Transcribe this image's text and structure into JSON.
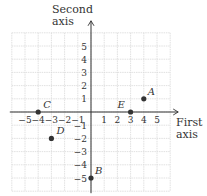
{
  "diagram": {
    "type": "coordinate-plane",
    "y_axis_title": [
      "Second",
      "axis"
    ],
    "x_axis_title": [
      "First",
      "axis"
    ],
    "x_ticks": [
      "-5",
      "-4",
      "-3",
      "-2",
      "-1",
      "1",
      "2",
      "3",
      "4",
      "5"
    ],
    "y_ticks": [
      "5",
      "4",
      "3",
      "2",
      "1",
      "-1",
      "-2",
      "-3",
      "-4",
      "-5"
    ],
    "grid_range": {
      "x": [
        -6,
        6
      ],
      "y": [
        -6,
        6
      ]
    },
    "points": [
      {
        "label": "A",
        "x": 4,
        "y": 1
      },
      {
        "label": "B",
        "x": 0,
        "y": -5
      },
      {
        "label": "C",
        "x": -4,
        "y": 0
      },
      {
        "label": "D",
        "x": -3,
        "y": -2
      },
      {
        "label": "E",
        "x": 3,
        "y": 0
      }
    ],
    "colors": {
      "grid": "#d9d9d9",
      "axis": "#333333",
      "point": "#333333",
      "text": "#333333"
    }
  }
}
